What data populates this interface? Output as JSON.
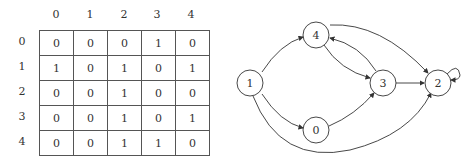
{
  "matrix": {
    "col_labels": [
      "0",
      "1",
      "2",
      "3",
      "4"
    ],
    "row_labels": [
      "0",
      "1",
      "2",
      "3",
      "4"
    ],
    "rows": [
      [
        "0",
        "0",
        "0",
        "1",
        "0"
      ],
      [
        "1",
        "0",
        "1",
        "0",
        "1"
      ],
      [
        "0",
        "0",
        "1",
        "0",
        "0"
      ],
      [
        "0",
        "0",
        "1",
        "0",
        "1"
      ],
      [
        "0",
        "0",
        "1",
        "1",
        "0"
      ]
    ]
  },
  "graph": {
    "nodes": [
      {
        "id": "1",
        "label": "1"
      },
      {
        "id": "4",
        "label": "4"
      },
      {
        "id": "3",
        "label": "3"
      },
      {
        "id": "0",
        "label": "0"
      },
      {
        "id": "2",
        "label": "2"
      }
    ],
    "edges": [
      [
        "1",
        "4"
      ],
      [
        "1",
        "0"
      ],
      [
        "1",
        "2"
      ],
      [
        "4",
        "3"
      ],
      [
        "3",
        "4"
      ],
      [
        "4",
        "2"
      ],
      [
        "3",
        "2"
      ],
      [
        "0",
        "3"
      ],
      [
        "2",
        "2"
      ]
    ]
  }
}
